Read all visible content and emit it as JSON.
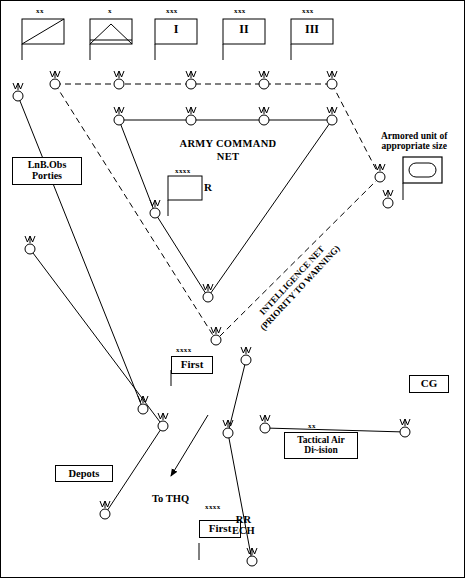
{
  "diagram": {
    "title_nets": {
      "army_command_net": "ARMY COMMAND\nNET",
      "army_command_net_line1": "ARMY COMMAND",
      "army_command_net_line2": "NET",
      "intelligence_net_line1": "INTELLIGENCE NET",
      "intelligence_net_line2": "(PRIORITY TO WARNING)"
    },
    "top_units": [
      {
        "echelon": "xx",
        "label": "",
        "symbol": "armored-cavalry-diagonal"
      },
      {
        "echelon": "x",
        "label": "",
        "symbol": "brigade-triangle"
      },
      {
        "echelon": "xxx",
        "label": "I",
        "symbol": "corps-flag"
      },
      {
        "echelon": "xxx",
        "label": "II",
        "symbol": "corps-flag"
      },
      {
        "echelon": "xxx",
        "label": "III",
        "symbol": "corps-flag"
      }
    ],
    "boxes": {
      "lnb_obs_line1": "LnB.Obs",
      "lnb_obs_line2": "Porties",
      "depots": "Depots",
      "cg": "CG",
      "tactical_air_line1": "Tactical Air",
      "tactical_air_line2": "Di~ision",
      "tactical_air_echelon": "xx",
      "armored_unit_line1": "Armored unit of",
      "armored_unit_line2": "appropriate size"
    },
    "flags": {
      "army_r_echelon": "xxxx",
      "army_r_label": "R",
      "first_echelon": "xxxx",
      "first_label": "First",
      "first_rr_echelon": "xxxx",
      "first_rr_label": "First",
      "rr_ech_line1": "RR",
      "rr_ech_line2": "ECH"
    },
    "annotations": {
      "to_thq": "To THQ"
    },
    "colors": {
      "stroke": "#000000",
      "background": "#ffffff",
      "node_fill": "#ffffff"
    },
    "nodes": [
      {
        "id": "n-top-1",
        "x": 18,
        "y": 96,
        "net": "command"
      },
      {
        "id": "n-top-2",
        "x": 55,
        "y": 84,
        "net": "intelligence"
      },
      {
        "id": "n-top-3",
        "x": 119,
        "y": 84,
        "net": "intelligence"
      },
      {
        "id": "n-top-4",
        "x": 191,
        "y": 84,
        "net": "intelligence"
      },
      {
        "id": "n-top-5",
        "x": 264,
        "y": 84,
        "net": "intelligence"
      },
      {
        "id": "n-top-6",
        "x": 332,
        "y": 84,
        "net": "intelligence"
      },
      {
        "id": "n-cmd-1",
        "x": 119,
        "y": 120,
        "net": "command"
      },
      {
        "id": "n-cmd-2",
        "x": 191,
        "y": 120,
        "net": "command"
      },
      {
        "id": "n-cmd-3",
        "x": 264,
        "y": 120,
        "net": "command"
      },
      {
        "id": "n-cmd-4",
        "x": 332,
        "y": 120,
        "net": "command"
      },
      {
        "id": "n-left-1",
        "x": 30,
        "y": 249,
        "net": "command"
      },
      {
        "id": "n-mid-1",
        "x": 155,
        "y": 213,
        "net": "command"
      },
      {
        "id": "n-mid-2",
        "x": 208,
        "y": 297,
        "net": "command"
      },
      {
        "id": "n-mid-3",
        "x": 216,
        "y": 340,
        "net": "command"
      },
      {
        "id": "n-right-1",
        "x": 380,
        "y": 177,
        "net": "intelligence"
      },
      {
        "id": "n-right-2",
        "x": 388,
        "y": 203,
        "net": "command"
      },
      {
        "id": "n-low-1",
        "x": 143,
        "y": 409,
        "net": "command"
      },
      {
        "id": "n-low-2",
        "x": 246,
        "y": 360,
        "net": "command"
      },
      {
        "id": "n-low-3",
        "x": 163,
        "y": 426,
        "net": "command"
      },
      {
        "id": "n-low-4",
        "x": 105,
        "y": 514,
        "net": "command"
      },
      {
        "id": "n-low-5",
        "x": 228,
        "y": 433,
        "net": "command"
      },
      {
        "id": "n-low-6",
        "x": 265,
        "y": 428,
        "net": "command"
      },
      {
        "id": "n-low-7",
        "x": 405,
        "y": 432,
        "net": "command"
      },
      {
        "id": "n-low-8",
        "x": 252,
        "y": 561,
        "net": "command"
      }
    ],
    "links": [
      {
        "from": "n-top-2",
        "to": "n-top-6",
        "style": "dashed"
      },
      {
        "from": "n-top-2",
        "to": "n-mid-3",
        "style": "dashed"
      },
      {
        "from": "n-top-6",
        "to": "n-right-1",
        "style": "dashed"
      },
      {
        "from": "n-right-1",
        "to": "n-mid-3",
        "style": "dashed"
      },
      {
        "from": "n-cmd-1",
        "to": "n-cmd-4",
        "style": "solid"
      },
      {
        "from": "n-cmd-1",
        "to": "n-mid-1",
        "style": "solid"
      },
      {
        "from": "n-mid-1",
        "to": "n-mid-2",
        "style": "solid"
      },
      {
        "from": "n-cmd-4",
        "to": "n-mid-2",
        "style": "solid"
      },
      {
        "from": "n-top-1",
        "to": "n-low-1",
        "style": "solid"
      },
      {
        "from": "n-left-1",
        "to": "n-low-3",
        "style": "solid"
      },
      {
        "from": "n-low-3",
        "to": "n-low-4",
        "style": "solid"
      },
      {
        "from": "n-low-2",
        "to": "n-low-5",
        "style": "solid"
      },
      {
        "from": "n-low-6",
        "to": "n-low-7",
        "style": "solid"
      },
      {
        "from": "n-low-5",
        "to": "n-low-8",
        "style": "solid"
      }
    ]
  }
}
